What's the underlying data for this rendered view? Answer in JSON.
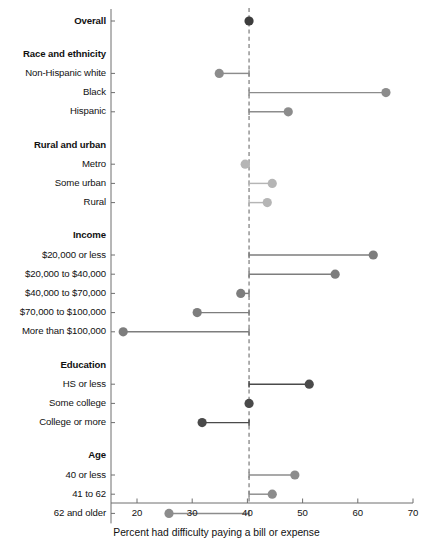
{
  "chart_data": {
    "type": "scatter",
    "title": "",
    "subtitle": "",
    "xlabel": "Percent had difficulty paying a bill or expense",
    "ylabel": "",
    "xlim": [
      20,
      70
    ],
    "xticks": [
      20,
      30,
      40,
      50,
      60,
      70
    ],
    "xtick_labels": [
      "20",
      "30",
      "40",
      "50",
      "60",
      "70"
    ],
    "grid": false,
    "legend": "none",
    "reference_line": {
      "value": 40.3,
      "style": "dashed",
      "orientation": "vertical",
      "color": "#7a7a7a"
    },
    "note": "Lollipop / dot-and-line chart: each dot is a subgroup percent; a horizontal connector runs from the dot to the dashed overall reference line at 40.3.",
    "groups": [
      {
        "group": "Overall",
        "group_header_shown": false,
        "color": "#3d3d3d",
        "items": [
          {
            "label": "Overall",
            "value": 40.3,
            "bold_label": true
          }
        ]
      },
      {
        "group": "Race and ethnicity",
        "group_header_shown": true,
        "color": "#8c8c8c",
        "items": [
          {
            "label": "Non-Hispanic white",
            "value": 34.9
          },
          {
            "label": "Black",
            "value": 65.1
          },
          {
            "label": "Hispanic",
            "value": 47.4
          }
        ]
      },
      {
        "group": "Rural and urban",
        "group_header_shown": true,
        "color": "#b5b5b5",
        "items": [
          {
            "label": "Metro",
            "value": 39.6
          },
          {
            "label": "Some urban",
            "value": 44.5
          },
          {
            "label": "Rural",
            "value": 43.6
          }
        ]
      },
      {
        "group": "Income",
        "group_header_shown": true,
        "color": "#7d7d7d",
        "items": [
          {
            "label": "$20,000 or less",
            "value": 62.8
          },
          {
            "label": "$20,000 to $40,000",
            "value": 55.9
          },
          {
            "label": "$40,000 to $70,000",
            "value": 38.8
          },
          {
            "label": "$70,000 to $100,000",
            "value": 30.9
          },
          {
            "label": "More than $100,000",
            "value": 17.5
          }
        ]
      },
      {
        "group": "Education",
        "group_header_shown": true,
        "color": "#4a4a4a",
        "items": [
          {
            "label": "HS or less",
            "value": 51.2
          },
          {
            "label": "Some college",
            "value": 40.3
          },
          {
            "label": "College or more",
            "value": 31.8
          }
        ]
      },
      {
        "group": "Age",
        "group_header_shown": true,
        "color": "#8c8c8c",
        "items": [
          {
            "label": "40 or less",
            "value": 48.6
          },
          {
            "label": "41 to 62",
            "value": 44.5
          },
          {
            "label": "62 and older",
            "value": 25.8
          }
        ]
      }
    ]
  },
  "axis": {
    "title": "Percent had difficulty paying a bill or expense",
    "ticks": [
      "20",
      "30",
      "40",
      "50",
      "60",
      "70"
    ]
  },
  "colors": {
    "axis": "#6e6e6e",
    "reference_line": "#7a7a7a",
    "text": "#111111",
    "background": "#ffffff"
  }
}
